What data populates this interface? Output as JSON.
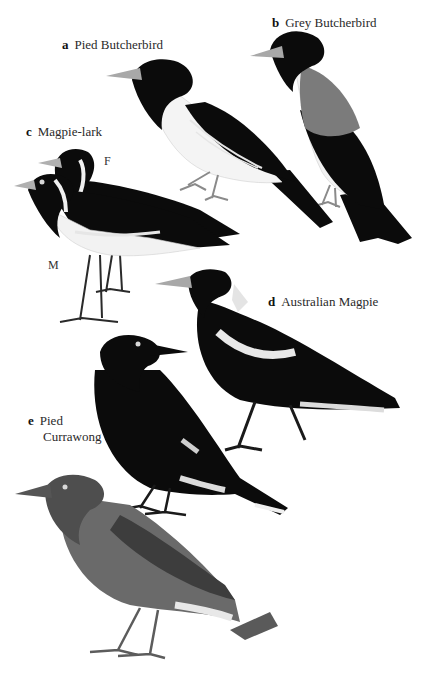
{
  "plate": {
    "background": "#ffffff",
    "species": [
      {
        "key": "a",
        "name": "Pied Butcherbird"
      },
      {
        "key": "b",
        "name": "Grey Butcherbird"
      },
      {
        "key": "c",
        "name": "Magpie-lark",
        "sex_labels": [
          "F",
          "M"
        ]
      },
      {
        "key": "d",
        "name": "Australian Magpie"
      },
      {
        "key": "e",
        "name": "Pied",
        "name_line2": "Currawong"
      }
    ],
    "colors": {
      "black": "#0b0b0b",
      "white": "#f4f4f4",
      "grey_back": "#7b7b7b",
      "currawong_body": "#6a6a6a",
      "currawong_wing": "#3d3d3d",
      "bill": "#a8a8a8",
      "legs": "#5c5c5c"
    }
  }
}
